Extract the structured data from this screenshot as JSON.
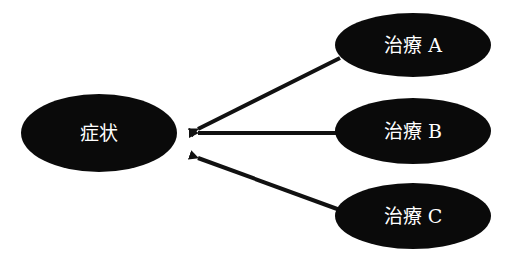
{
  "diagram": {
    "type": "causal-arrows",
    "colors": {
      "node_fill": "#0a0a0a",
      "node_text": "#ffffff",
      "arrow": "#111111",
      "background": "#ffffff"
    },
    "target": {
      "id": "symptom",
      "label": "症状"
    },
    "sources": [
      {
        "id": "treatment-a",
        "label": "治療 A"
      },
      {
        "id": "treatment-b",
        "label": "治療 B"
      },
      {
        "id": "treatment-c",
        "label": "治療 C"
      }
    ],
    "edges": [
      {
        "from": "treatment-a",
        "to": "symptom"
      },
      {
        "from": "treatment-b",
        "to": "symptom"
      },
      {
        "from": "treatment-c",
        "to": "symptom"
      }
    ]
  }
}
